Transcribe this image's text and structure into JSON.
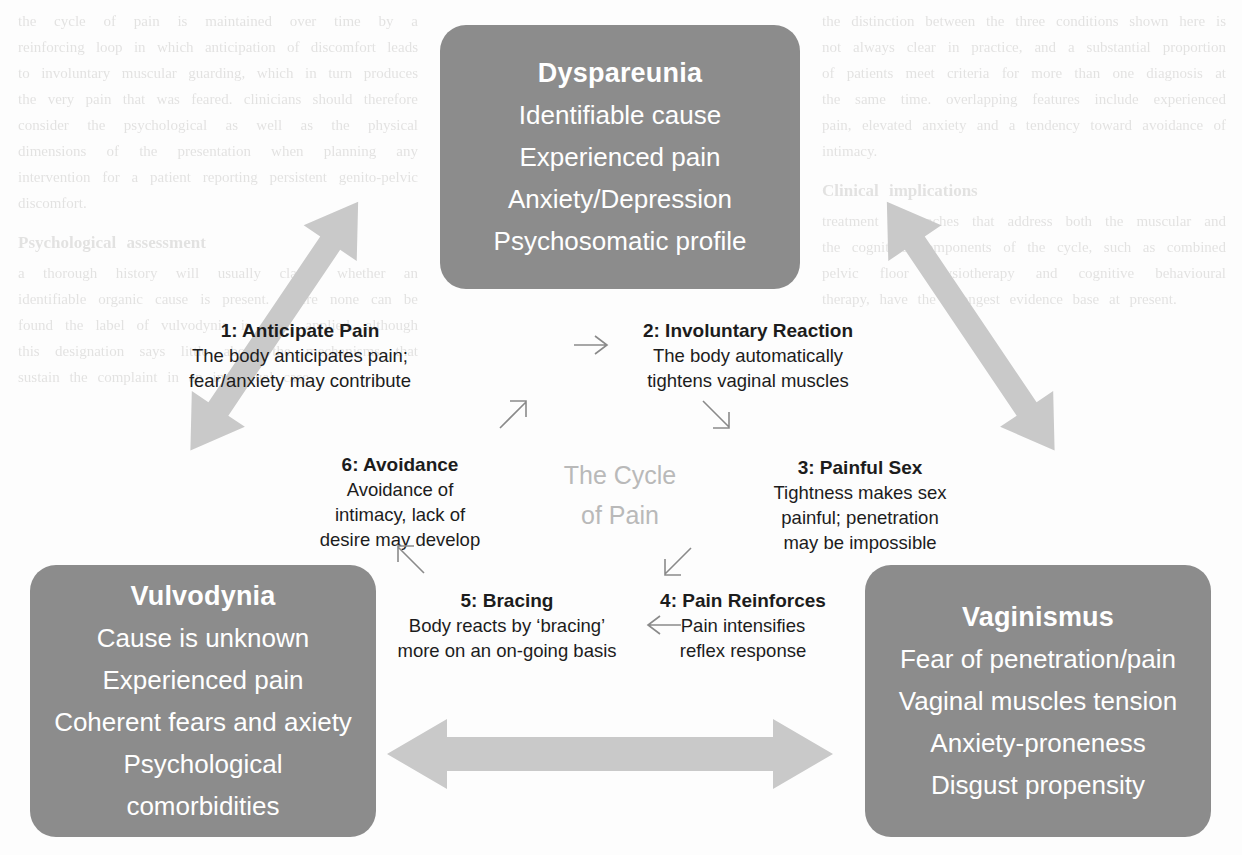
{
  "diagram": {
    "center_caption_line1": "The Cycle",
    "center_caption_line2": "of Pain",
    "colors": {
      "box_fill": "#8c8c8c",
      "box_text": "#ffffff",
      "arrow_fill": "#c9c9c9",
      "caption_text": "#b9b9b9",
      "step_text": "#1c1c1c"
    },
    "boxes": [
      {
        "id": "dyspareunia",
        "title": "Dyspareunia",
        "lines": [
          "Identifiable cause",
          "Experienced pain",
          "Anxiety/Depression",
          "Psychosomatic profile"
        ]
      },
      {
        "id": "vulvodynia",
        "title": "Vulvodynia",
        "lines": [
          "Cause is unknown",
          "Experienced pain",
          "Coherent fears and axiety",
          "Psychological comorbidities"
        ]
      },
      {
        "id": "vaginismus",
        "title": "Vaginismus",
        "lines": [
          "Fear of penetration/pain",
          "Vaginal muscles tension",
          "Anxiety-proneness",
          "Disgust propensity"
        ]
      }
    ],
    "steps": [
      {
        "number": "1",
        "title": "1: Anticipate Pain",
        "desc_line1": "The body anticipates pain;",
        "desc_line2": "fear/anxiety may contribute",
        "desc_line3": ""
      },
      {
        "number": "2",
        "title": "2: Involuntary Reaction",
        "desc_line1": "The body automatically",
        "desc_line2": "tightens vaginal muscles",
        "desc_line3": ""
      },
      {
        "number": "3",
        "title": "3: Painful Sex",
        "desc_line1": "Tightness makes sex",
        "desc_line2": "painful; penetration",
        "desc_line3": "may be impossible"
      },
      {
        "number": "4",
        "title": "4: Pain Reinforces",
        "desc_line1": "Pain intensifies",
        "desc_line2": "reflex response",
        "desc_line3": ""
      },
      {
        "number": "5",
        "title": "5: Bracing",
        "desc_line1": "Body reacts by ‘bracing’",
        "desc_line2": "more on an on-going basis",
        "desc_line3": ""
      },
      {
        "number": "6",
        "title": "6: Avoidance",
        "desc_line1": "Avoidance of",
        "desc_line2": "intimacy, lack of",
        "desc_line3": "desire may develop"
      }
    ],
    "connectors": [
      {
        "id": "arrow-left-diagonal",
        "kind": "double-headed-block-arrow",
        "orientation": "diagonal-up-right"
      },
      {
        "id": "arrow-right-diagonal",
        "kind": "double-headed-block-arrow",
        "orientation": "diagonal-down-right"
      },
      {
        "id": "arrow-bottom-horizontal",
        "kind": "double-headed-block-arrow",
        "orientation": "horizontal"
      }
    ]
  },
  "background_text": {
    "left_column": "the cycle of pain is maintained over time by a reinforcing loop in which anticipation of discomfort leads to involuntary muscular guarding, which in turn produces the very pain that was feared. clinicians should therefore consider the psychological as well as the physical dimensions of the presentation when planning any intervention for a patient reporting persistent genito-pelvic discomfort.",
    "left_heading": "Psychological assessment",
    "left_column_2": "a thorough history will usually clarify whether an identifiable organic cause is present. where none can be found the label of vulvodynia is often applied, although this designation says little about the mechanisms that sustain the complaint in an individual case.",
    "right_column": "the distinction between the three conditions shown here is not always clear in practice, and a substantial proportion of patients meet criteria for more than one diagnosis at the same time. overlapping features include experienced pain, elevated anxiety and a tendency toward avoidance of intimacy.",
    "right_heading": "Clinical implications",
    "right_column_2": "treatment approaches that address both the muscular and the cognitive components of the cycle, such as combined pelvic floor physiotherapy and cognitive behavioural therapy, have the strongest evidence base at present."
  }
}
